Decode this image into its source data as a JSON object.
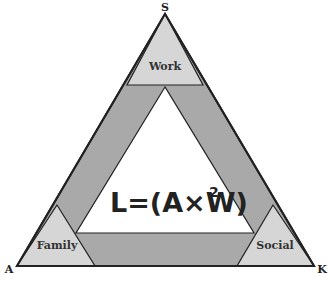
{
  "diagram": {
    "vertices": {
      "top": "S",
      "bottom_left": "A",
      "bottom_right": "K"
    },
    "corners": {
      "top": "Work",
      "bottom_left": "Family",
      "bottom_right": "Social"
    },
    "formula": {
      "main": "L=(A×W)",
      "exponent": "2"
    },
    "colors": {
      "corner_fill": "#d6d6d6",
      "band_fill": "#a9a9a9",
      "inner_fill": "#ffffff",
      "stroke": "#222222"
    }
  }
}
